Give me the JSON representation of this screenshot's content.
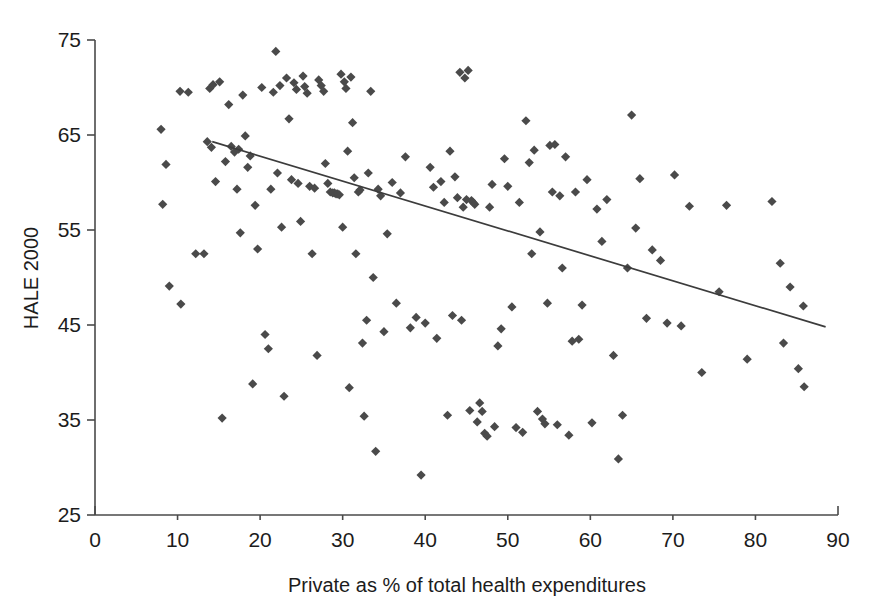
{
  "chart_data": {
    "type": "scatter",
    "title": "",
    "xlabel": "Private as % of total health expenditures",
    "ylabel": "HALE 2000",
    "xlim": [
      0,
      90
    ],
    "ylim": [
      25,
      75
    ],
    "xticks": [
      0,
      10,
      20,
      30,
      40,
      50,
      60,
      70,
      80,
      90
    ],
    "yticks": [
      25,
      35,
      45,
      55,
      65,
      75
    ],
    "grid": false,
    "legend": "none",
    "marker": "diamond",
    "marker_color": "#4a4a4a",
    "trend_line": {
      "label": "linear fit",
      "color": "#3c3c3c",
      "x_start": 14.2,
      "y_start": 64.3,
      "x_end": 88.5,
      "y_end": 44.8
    },
    "series": [
      {
        "name": "Countries",
        "points": [
          [
            8.0,
            65.6
          ],
          [
            8.2,
            57.7
          ],
          [
            8.6,
            61.9
          ],
          [
            9.0,
            49.1
          ],
          [
            10.3,
            69.6
          ],
          [
            10.4,
            47.2
          ],
          [
            11.3,
            69.5
          ],
          [
            12.2,
            52.5
          ],
          [
            13.2,
            52.5
          ],
          [
            13.6,
            64.3
          ],
          [
            13.9,
            69.9
          ],
          [
            14.1,
            63.7
          ],
          [
            14.3,
            70.3
          ],
          [
            14.6,
            60.1
          ],
          [
            15.1,
            70.6
          ],
          [
            15.4,
            35.2
          ],
          [
            15.8,
            62.2
          ],
          [
            16.2,
            68.2
          ],
          [
            16.5,
            63.8
          ],
          [
            16.9,
            63.2
          ],
          [
            17.2,
            59.3
          ],
          [
            17.4,
            63.5
          ],
          [
            17.6,
            54.7
          ],
          [
            17.9,
            69.2
          ],
          [
            18.2,
            64.9
          ],
          [
            18.5,
            61.6
          ],
          [
            18.8,
            62.8
          ],
          [
            19.1,
            38.8
          ],
          [
            19.4,
            57.6
          ],
          [
            19.7,
            53.0
          ],
          [
            20.2,
            70.0
          ],
          [
            20.6,
            44.0
          ],
          [
            21.0,
            42.5
          ],
          [
            21.3,
            59.3
          ],
          [
            21.6,
            69.5
          ],
          [
            21.9,
            73.8
          ],
          [
            22.1,
            61.0
          ],
          [
            22.4,
            70.2
          ],
          [
            22.6,
            55.3
          ],
          [
            22.9,
            37.5
          ],
          [
            23.2,
            71.0
          ],
          [
            23.5,
            66.7
          ],
          [
            23.8,
            60.3
          ],
          [
            24.1,
            70.5
          ],
          [
            24.4,
            69.8
          ],
          [
            24.6,
            59.9
          ],
          [
            24.9,
            55.9
          ],
          [
            25.2,
            71.2
          ],
          [
            25.4,
            70.1
          ],
          [
            25.7,
            69.4
          ],
          [
            26.0,
            59.6
          ],
          [
            26.3,
            52.5
          ],
          [
            26.6,
            59.4
          ],
          [
            26.9,
            41.8
          ],
          [
            27.1,
            70.8
          ],
          [
            27.4,
            70.2
          ],
          [
            27.7,
            69.6
          ],
          [
            27.9,
            62.0
          ],
          [
            28.2,
            59.9
          ],
          [
            28.5,
            59.0
          ],
          [
            28.8,
            58.9
          ],
          [
            29.0,
            58.9
          ],
          [
            29.2,
            58.8
          ],
          [
            29.4,
            58.8
          ],
          [
            29.6,
            58.7
          ],
          [
            29.8,
            71.4
          ],
          [
            30.0,
            55.3
          ],
          [
            30.2,
            70.6
          ],
          [
            30.4,
            69.9
          ],
          [
            30.6,
            63.3
          ],
          [
            30.8,
            38.4
          ],
          [
            31.0,
            71.1
          ],
          [
            31.2,
            66.3
          ],
          [
            31.4,
            60.5
          ],
          [
            31.6,
            52.5
          ],
          [
            31.9,
            59.0
          ],
          [
            32.1,
            59.2
          ],
          [
            32.4,
            43.1
          ],
          [
            32.6,
            35.4
          ],
          [
            32.9,
            45.5
          ],
          [
            33.1,
            61.0
          ],
          [
            33.4,
            69.6
          ],
          [
            33.7,
            50.0
          ],
          [
            34.0,
            31.7
          ],
          [
            34.3,
            59.3
          ],
          [
            34.6,
            58.6
          ],
          [
            35.0,
            44.3
          ],
          [
            35.4,
            54.6
          ],
          [
            36.0,
            60.0
          ],
          [
            36.5,
            47.3
          ],
          [
            37.0,
            58.9
          ],
          [
            37.6,
            62.7
          ],
          [
            38.2,
            44.7
          ],
          [
            38.9,
            45.8
          ],
          [
            39.5,
            29.2
          ],
          [
            40.0,
            45.2
          ],
          [
            40.6,
            61.6
          ],
          [
            41.0,
            59.5
          ],
          [
            41.4,
            43.6
          ],
          [
            41.9,
            60.1
          ],
          [
            42.3,
            57.9
          ],
          [
            42.7,
            35.5
          ],
          [
            43.0,
            63.3
          ],
          [
            43.3,
            46.0
          ],
          [
            43.6,
            60.6
          ],
          [
            43.9,
            58.4
          ],
          [
            44.2,
            71.6
          ],
          [
            44.4,
            45.5
          ],
          [
            44.6,
            57.4
          ],
          [
            44.8,
            71.0
          ],
          [
            45.0,
            58.2
          ],
          [
            45.2,
            71.8
          ],
          [
            45.4,
            36.0
          ],
          [
            45.6,
            58.1
          ],
          [
            45.8,
            57.9
          ],
          [
            46.0,
            57.7
          ],
          [
            46.3,
            34.8
          ],
          [
            46.6,
            36.8
          ],
          [
            46.9,
            35.9
          ],
          [
            47.2,
            33.6
          ],
          [
            47.5,
            33.3
          ],
          [
            47.8,
            57.4
          ],
          [
            48.1,
            59.8
          ],
          [
            48.4,
            34.3
          ],
          [
            48.8,
            42.8
          ],
          [
            49.2,
            44.6
          ],
          [
            49.6,
            62.5
          ],
          [
            50.0,
            59.6
          ],
          [
            50.5,
            46.9
          ],
          [
            51.0,
            34.2
          ],
          [
            51.4,
            57.9
          ],
          [
            51.8,
            33.7
          ],
          [
            52.2,
            66.5
          ],
          [
            52.6,
            62.1
          ],
          [
            52.9,
            52.5
          ],
          [
            53.2,
            63.4
          ],
          [
            53.6,
            35.9
          ],
          [
            53.9,
            54.8
          ],
          [
            54.2,
            35.1
          ],
          [
            54.5,
            34.6
          ],
          [
            54.8,
            47.3
          ],
          [
            55.1,
            63.9
          ],
          [
            55.4,
            59.0
          ],
          [
            55.7,
            64.0
          ],
          [
            56.0,
            34.5
          ],
          [
            56.3,
            58.6
          ],
          [
            56.6,
            51.0
          ],
          [
            57.0,
            62.7
          ],
          [
            57.4,
            33.4
          ],
          [
            57.8,
            43.3
          ],
          [
            58.2,
            59.0
          ],
          [
            58.6,
            43.5
          ],
          [
            59.0,
            47.1
          ],
          [
            59.6,
            60.3
          ],
          [
            60.2,
            34.7
          ],
          [
            60.8,
            57.2
          ],
          [
            61.4,
            53.8
          ],
          [
            62.0,
            58.2
          ],
          [
            62.8,
            41.8
          ],
          [
            63.4,
            30.9
          ],
          [
            63.9,
            35.5
          ],
          [
            64.5,
            51.0
          ],
          [
            65.0,
            67.1
          ],
          [
            65.5,
            55.2
          ],
          [
            66.0,
            60.4
          ],
          [
            66.8,
            45.7
          ],
          [
            67.5,
            52.9
          ],
          [
            68.5,
            51.8
          ],
          [
            69.3,
            45.2
          ],
          [
            70.2,
            60.8
          ],
          [
            71.0,
            44.9
          ],
          [
            72.0,
            57.5
          ],
          [
            73.5,
            40.0
          ],
          [
            75.6,
            48.5
          ],
          [
            76.5,
            57.6
          ],
          [
            79.0,
            41.4
          ],
          [
            82.0,
            58.0
          ],
          [
            83.0,
            51.5
          ],
          [
            83.4,
            43.1
          ],
          [
            84.2,
            49.0
          ],
          [
            85.2,
            40.4
          ],
          [
            85.8,
            47.0
          ],
          [
            85.9,
            38.5
          ]
        ]
      }
    ]
  },
  "axes": {
    "y_tick_labels": [
      "75",
      "65",
      "55",
      "45",
      "35",
      "25"
    ],
    "x_tick_labels": [
      "0",
      "10",
      "20",
      "30",
      "40",
      "50",
      "60",
      "70",
      "80",
      "90"
    ]
  }
}
